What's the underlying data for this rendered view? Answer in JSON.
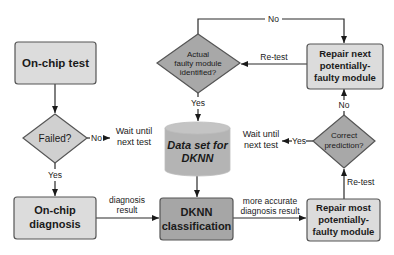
{
  "diagram": {
    "nodes": {
      "on_chip_test": {
        "label": "On-chip test",
        "shape": "rect",
        "fill": "#dcdcdc"
      },
      "failed": {
        "label": "Failed?",
        "shape": "diamond",
        "fill": "#d0d0d0"
      },
      "on_chip_diagnosis": {
        "line1": "On-chip",
        "line2": "diagnosis",
        "shape": "rect",
        "fill": "#dcdcdc"
      },
      "dknn_classification": {
        "line1": "DKNN",
        "line2": "classification",
        "shape": "rect",
        "fill": "#a6a6a6"
      },
      "data_set": {
        "line1": "Data set for",
        "line2": "DKNN",
        "shape": "cylinder",
        "fill": "#b4b4b4"
      },
      "actual_faulty": {
        "line1": "Actual",
        "line2": "faulty module",
        "line3": "identified?",
        "shape": "diamond",
        "fill": "#a8a8a8"
      },
      "repair_next": {
        "line1": "Repair next",
        "line2": "potentially-",
        "line3": "faulty module",
        "shape": "rect",
        "fill": "#dcdcdc"
      },
      "correct_prediction": {
        "line1": "Correct",
        "line2": "prediction?",
        "shape": "diamond",
        "fill": "#a8a8a8"
      },
      "repair_most": {
        "line1": "Repair most",
        "line2": "potentially-",
        "line3": "faulty module",
        "shape": "rect",
        "fill": "#dcdcdc"
      },
      "wait_1": {
        "line1": "Wait until",
        "line2": "next test"
      },
      "wait_2": {
        "line1": "Wait until",
        "line2": "next test"
      }
    },
    "edges": {
      "failed_no": "No",
      "failed_yes": "Yes",
      "diag_result_1": "diagnosis",
      "diag_result_2": "result",
      "more_accurate_1": "more accurate",
      "more_accurate_2": "diagnosis result",
      "retest_bottom": "Re-test",
      "correct_yes": "Yes",
      "correct_no": "No",
      "retest_top": "Re-test",
      "actual_no": "No",
      "actual_yes": "Yes"
    },
    "colors": {
      "line": "#2a2a2a",
      "border": "#555555"
    }
  }
}
